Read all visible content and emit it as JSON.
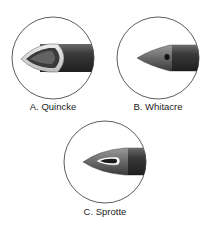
{
  "figure": {
    "needles": [
      {
        "id": "A",
        "label": "A. Quincke",
        "type": "cutting bevel"
      },
      {
        "id": "B",
        "label": "B. Whitacre",
        "type": "pencil-point, side hole"
      },
      {
        "id": "C",
        "label": "C. Sprotte",
        "type": "pencil-point, long side slot"
      }
    ]
  }
}
